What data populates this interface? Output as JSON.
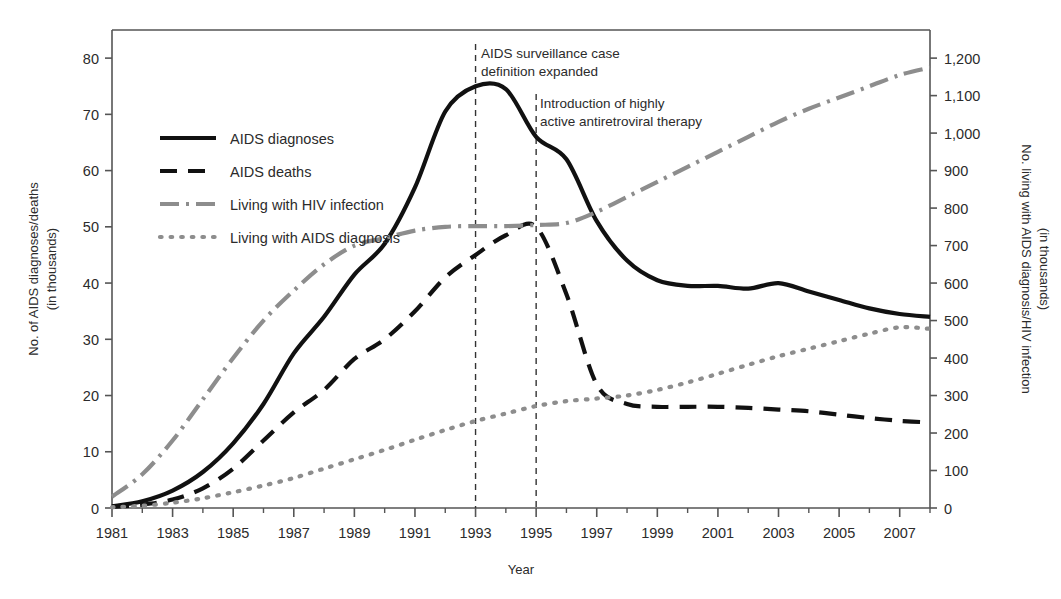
{
  "figure": {
    "background": "#ffffff",
    "frame_color": "#444444"
  },
  "chart_data": {
    "type": "line",
    "title": "",
    "subtitle": "",
    "xlabel": "Year",
    "ylabel": "No. of AIDS diagnoses/deaths (in thousands)",
    "ylabel_line1": "No. of AIDS diagnoses/deaths",
    "ylabel_line2": "(in thousands)",
    "y2label": "No. living with AIDS diagnosis/HIV infection (in thousands)",
    "y2label_line1": "No. living with AIDS diagnosis/HIV infection",
    "y2label_line2": "(in thousands)",
    "grid": false,
    "legend_position": "upper-left-inside",
    "xlim": [
      1981,
      2008
    ],
    "x_ticks": [
      1981,
      1983,
      1985,
      1987,
      1989,
      1991,
      1993,
      1995,
      1997,
      1999,
      2001,
      2003,
      2005,
      2007
    ],
    "x_tick_labels": [
      "1981",
      "1983",
      "1985",
      "1987",
      "1989",
      "1991",
      "1993",
      "1995",
      "1997",
      "1999",
      "2001",
      "2003",
      "2005",
      "2007"
    ],
    "x_minor_ticks": [
      1982,
      1984,
      1986,
      1988,
      1990,
      1992,
      1994,
      1996,
      1998,
      2000,
      2002,
      2004,
      2006,
      2008
    ],
    "ylim": [
      0,
      85
    ],
    "y_ticks": [
      0,
      10,
      20,
      30,
      40,
      50,
      60,
      70,
      80
    ],
    "y_tick_labels": [
      "0",
      "10",
      "20",
      "30",
      "40",
      "50",
      "60",
      "70",
      "80"
    ],
    "y2lim": [
      0,
      1275
    ],
    "y2_ticks": [
      0,
      100,
      200,
      300,
      400,
      500,
      600,
      700,
      800,
      900,
      1000,
      1100,
      1200
    ],
    "y2_tick_labels": [
      "0",
      "100",
      "200",
      "300",
      "400",
      "500",
      "600",
      "700",
      "800",
      "900",
      "1,000",
      "1,100",
      "1,200"
    ],
    "x": [
      1981,
      1982,
      1983,
      1984,
      1985,
      1986,
      1987,
      1988,
      1989,
      1990,
      1991,
      1992,
      1993,
      1994,
      1995,
      1996,
      1997,
      1998,
      1999,
      2000,
      2001,
      2002,
      2003,
      2004,
      2005,
      2006,
      2007,
      2008
    ],
    "series": [
      {
        "name": "AIDS diagnoses",
        "axis": "left",
        "style": "solid",
        "color": "#111111",
        "width": 4.2,
        "values": [
          0.3,
          1.2,
          3.1,
          6.4,
          11.5,
          18.5,
          27.5,
          34.0,
          41.5,
          47.0,
          57.0,
          70.5,
          75.0,
          74.5,
          66.0,
          62.0,
          51.0,
          44.0,
          40.5,
          39.5,
          39.5,
          39.0,
          40.0,
          38.5,
          37.0,
          35.5,
          34.5,
          34.0
        ]
      },
      {
        "name": "AIDS deaths",
        "axis": "left",
        "style": "dashed",
        "color": "#111111",
        "width": 4.2,
        "values": [
          0.2,
          0.6,
          1.5,
          3.5,
          7.0,
          12.0,
          17.0,
          21.0,
          26.5,
          30.0,
          35.0,
          41.0,
          45.0,
          48.5,
          50.0,
          38.0,
          22.0,
          18.5,
          18.0,
          18.0,
          18.0,
          17.8,
          17.5,
          17.2,
          16.6,
          16.0,
          15.5,
          15.2
        ]
      },
      {
        "name": "Living with HIV infection",
        "axis": "right",
        "style": "dashdot",
        "color": "#8d8d8d",
        "width": 4.2,
        "values": [
          30,
          90,
          180,
          290,
          400,
          500,
          580,
          650,
          700,
          720,
          740,
          750,
          752,
          752,
          755,
          760,
          790,
          830,
          870,
          910,
          950,
          990,
          1030,
          1065,
          1095,
          1125,
          1155,
          1175
        ]
      },
      {
        "name": "Living with AIDS diagnosis",
        "axis": "right",
        "style": "dotted",
        "color": "#8d8d8d",
        "width": 4.2,
        "values": [
          2,
          6,
          14,
          26,
          42,
          60,
          80,
          105,
          130,
          155,
          182,
          208,
          232,
          252,
          272,
          285,
          292,
          300,
          315,
          335,
          358,
          382,
          405,
          425,
          445,
          465,
          482,
          478
        ]
      }
    ],
    "legend": [
      {
        "label": "AIDS diagnoses",
        "style": "solid",
        "color": "#111111"
      },
      {
        "label": "AIDS deaths",
        "style": "dashed",
        "color": "#111111"
      },
      {
        "label": "Living with HIV infection",
        "style": "dashdot",
        "color": "#8d8d8d"
      },
      {
        "label": "Living with AIDS diagnosis",
        "style": "dotted",
        "color": "#8d8d8d"
      }
    ],
    "annotations": [
      {
        "id": "case-definition",
        "line1": "AIDS surveillance case",
        "line2": "definition expanded",
        "vline_year": 1993
      },
      {
        "id": "haart",
        "line1": "Introduction of highly",
        "line2": "active antiretroviral therapy",
        "vline_year": 1995
      }
    ]
  }
}
